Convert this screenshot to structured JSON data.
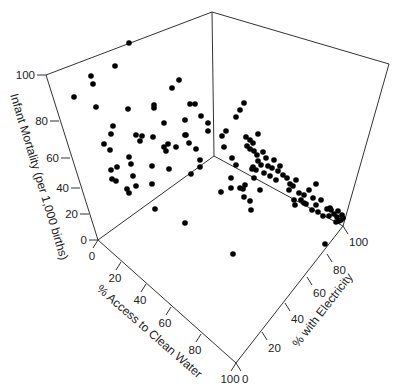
{
  "chart_data": {
    "type": "scatter",
    "subtype": "3d-scatter",
    "title": "",
    "axes": {
      "z": {
        "label": "Infant Mortality (per 1,000 births)",
        "ticks": [
          "0",
          "20",
          "40",
          "60",
          "80",
          "100"
        ],
        "range": [
          0,
          100
        ]
      },
      "x": {
        "label": "% Access to Clean Water",
        "ticks": [
          "0",
          "20",
          "40",
          "60",
          "80",
          "100"
        ],
        "range": [
          0,
          100
        ]
      },
      "y": {
        "label": "% with Electricity",
        "ticks": [
          "0",
          "20",
          "40",
          "60",
          "80",
          "100"
        ],
        "range": [
          0,
          100
        ]
      }
    },
    "frame": {
      "origin": [
        98,
        240
      ],
      "z_top": [
        46,
        75
      ],
      "back_bottom": [
        214,
        156
      ],
      "back_top": [
        212,
        12
      ],
      "right_bottom": [
        343,
        226
      ],
      "right_top": [
        389,
        64
      ],
      "front_bottom": [
        236,
        363
      ]
    },
    "tick_positions": {
      "z": [
        [
          98,
          240
        ],
        [
          89,
          214
        ],
        [
          80,
          188
        ],
        [
          70,
          158
        ],
        [
          59,
          121
        ],
        [
          46,
          75
        ]
      ],
      "x": [
        [
          98,
          240
        ],
        [
          121,
          262
        ],
        [
          146,
          284
        ],
        [
          171,
          307
        ],
        [
          201,
          334
        ],
        [
          236,
          363
        ]
      ],
      "y": [
        [
          236,
          363
        ],
        [
          262,
          332
        ],
        [
          285,
          303
        ],
        [
          307,
          277
        ],
        [
          327,
          254
        ],
        [
          343,
          226
        ]
      ]
    },
    "points_screen": [
      [
        129,
        43
      ],
      [
        115,
        66
      ],
      [
        91,
        76
      ],
      [
        93,
        84
      ],
      [
        74,
        97
      ],
      [
        96,
        107
      ],
      [
        128,
        109
      ],
      [
        154,
        108
      ],
      [
        113,
        126
      ],
      [
        179,
        80
      ],
      [
        172,
        88
      ],
      [
        154,
        105
      ],
      [
        190,
        104
      ],
      [
        195,
        104
      ],
      [
        201,
        116
      ],
      [
        164,
        123
      ],
      [
        185,
        120
      ],
      [
        185,
        135
      ],
      [
        111,
        134
      ],
      [
        104,
        144
      ],
      [
        136,
        135
      ],
      [
        142,
        136
      ],
      [
        140,
        141
      ],
      [
        153,
        137
      ],
      [
        186,
        135
      ],
      [
        189,
        143
      ],
      [
        164,
        147
      ],
      [
        168,
        144
      ],
      [
        166,
        151
      ],
      [
        176,
        147
      ],
      [
        208,
        131
      ],
      [
        200,
        160
      ],
      [
        200,
        167
      ],
      [
        110,
        150
      ],
      [
        111,
        170
      ],
      [
        117,
        167
      ],
      [
        112,
        179
      ],
      [
        116,
        181
      ],
      [
        129,
        157
      ],
      [
        131,
        164
      ],
      [
        133,
        176
      ],
      [
        127,
        189
      ],
      [
        129,
        193
      ],
      [
        136,
        186
      ],
      [
        152,
        166
      ],
      [
        152,
        184
      ],
      [
        169,
        169
      ],
      [
        196,
        149
      ],
      [
        191,
        174
      ],
      [
        155,
        209
      ],
      [
        185,
        223
      ],
      [
        233,
        254
      ],
      [
        221,
        192
      ],
      [
        240,
        188
      ],
      [
        208,
        123
      ],
      [
        222,
        136
      ],
      [
        226,
        131
      ],
      [
        224,
        147
      ],
      [
        236,
        117
      ],
      [
        244,
        103
      ],
      [
        240,
        110
      ],
      [
        232,
        158
      ],
      [
        236,
        165
      ],
      [
        231,
        178
      ],
      [
        231,
        188
      ],
      [
        245,
        185
      ],
      [
        252,
        169
      ],
      [
        254,
        178
      ],
      [
        244,
        197
      ],
      [
        243,
        189
      ],
      [
        260,
        190
      ],
      [
        250,
        201
      ],
      [
        251,
        210
      ],
      [
        256,
        170
      ],
      [
        253,
        167
      ],
      [
        246,
        137
      ],
      [
        250,
        140
      ],
      [
        247,
        146
      ],
      [
        250,
        149
      ],
      [
        253,
        143
      ],
      [
        254,
        151
      ],
      [
        258,
        134
      ],
      [
        257,
        155
      ],
      [
        258,
        161
      ],
      [
        263,
        152
      ],
      [
        261,
        165
      ],
      [
        264,
        173
      ],
      [
        268,
        166
      ],
      [
        270,
        176
      ],
      [
        266,
        158
      ],
      [
        274,
        160
      ],
      [
        272,
        168
      ],
      [
        278,
        171
      ],
      [
        280,
        166
      ],
      [
        283,
        175
      ],
      [
        276,
        180
      ],
      [
        287,
        178
      ],
      [
        290,
        184
      ],
      [
        289,
        190
      ],
      [
        293,
        186
      ],
      [
        296,
        180
      ],
      [
        299,
        193
      ],
      [
        294,
        200
      ],
      [
        301,
        200
      ],
      [
        304,
        195
      ],
      [
        306,
        204
      ],
      [
        309,
        190
      ],
      [
        313,
        198
      ],
      [
        316,
        205
      ],
      [
        312,
        210
      ],
      [
        318,
        212
      ],
      [
        321,
        200
      ],
      [
        323,
        216
      ],
      [
        327,
        209
      ],
      [
        329,
        216
      ],
      [
        331,
        210
      ],
      [
        334,
        214
      ],
      [
        337,
        217
      ],
      [
        339,
        221
      ],
      [
        342,
        215
      ],
      [
        341,
        220
      ],
      [
        336,
        222
      ],
      [
        338,
        211
      ],
      [
        343,
        218
      ],
      [
        325,
        244
      ],
      [
        330,
        208
      ],
      [
        316,
        184
      ],
      [
        304,
        203
      ],
      [
        295,
        205
      ]
    ]
  }
}
